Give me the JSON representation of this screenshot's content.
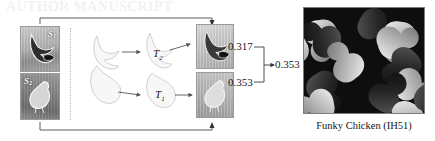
{
  "figure": {
    "watermark_text": "AUTHOR MANUSCRIPT",
    "background_color": "#ffffff"
  },
  "source_panel": {
    "name": "source-image-pair",
    "images": [
      {
        "id": "source-top",
        "label": "S",
        "subscript": "1",
        "label_position": "top-right",
        "description": "dark bird silhouette photo"
      },
      {
        "id": "source-bottom",
        "label": "S",
        "subscript": "2",
        "label_position": "top-left",
        "description": "light chicken silhouette photo"
      }
    ],
    "divider": "dotted-vertical-line"
  },
  "shape_panel": {
    "name": "silhouette-transform-diagram",
    "input_shapes": [
      {
        "id": "input-shape-top",
        "description": "bird outline silhouette"
      },
      {
        "id": "input-shape-bottom",
        "description": "chicken outline silhouette"
      }
    ],
    "transforms": [
      {
        "id": "transform-2",
        "label": "T",
        "subscript": "2"
      },
      {
        "id": "transform-1",
        "label": "T",
        "subscript": "1"
      }
    ]
  },
  "result_panel": {
    "name": "result-image-pair",
    "images": [
      {
        "id": "result-top",
        "description": "dark bird result tile"
      },
      {
        "id": "result-bottom",
        "description": "light chicken result tile"
      }
    ]
  },
  "scores": {
    "top": "0.317",
    "bottom": "0.353",
    "combined": "0.353"
  },
  "tile": {
    "name": "funky-chicken-tiling",
    "caption": "Funky Chicken (IH51)",
    "description": "black and white interlocking chicken tessellation"
  }
}
